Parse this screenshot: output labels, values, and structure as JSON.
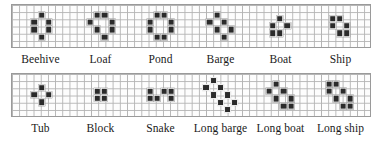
{
  "figure": {
    "grid": {
      "cell_px": 7.2,
      "line_color": "#b3b3b3",
      "border_color": "#9a9a9a",
      "cell_color": "#2b2b2b",
      "background": "#fdfdfd"
    },
    "rows": [
      {
        "row_index": 0,
        "patterns": [
          {
            "name": "Beehive",
            "width": 3,
            "height": 4,
            "cells": [
              [
                0,
                1
              ],
              [
                1,
                0
              ],
              [
                1,
                2
              ],
              [
                2,
                0
              ],
              [
                2,
                2
              ],
              [
                3,
                1
              ]
            ]
          },
          {
            "name": "Loaf",
            "width": 4,
            "height": 4,
            "cells": [
              [
                0,
                1
              ],
              [
                0,
                2
              ],
              [
                1,
                0
              ],
              [
                1,
                3
              ],
              [
                2,
                1
              ],
              [
                2,
                3
              ],
              [
                3,
                2
              ]
            ]
          },
          {
            "name": "Pond",
            "width": 4,
            "height": 4,
            "cells": [
              [
                0,
                1
              ],
              [
                0,
                2
              ],
              [
                1,
                0
              ],
              [
                1,
                3
              ],
              [
                2,
                0
              ],
              [
                2,
                3
              ],
              [
                3,
                1
              ],
              [
                3,
                2
              ]
            ]
          },
          {
            "name": "Barge",
            "width": 4,
            "height": 4,
            "cells": [
              [
                0,
                1
              ],
              [
                1,
                0
              ],
              [
                1,
                2
              ],
              [
                2,
                1
              ],
              [
                2,
                3
              ],
              [
                3,
                2
              ]
            ]
          },
          {
            "name": "Boat",
            "width": 3,
            "height": 3,
            "cells": [
              [
                0,
                1
              ],
              [
                1,
                0
              ],
              [
                1,
                2
              ],
              [
                2,
                0
              ],
              [
                2,
                1
              ]
            ]
          },
          {
            "name": "Ship",
            "width": 3,
            "height": 3,
            "cells": [
              [
                0,
                0
              ],
              [
                0,
                1
              ],
              [
                1,
                0
              ],
              [
                1,
                2
              ],
              [
                2,
                1
              ],
              [
                2,
                2
              ]
            ]
          }
        ]
      },
      {
        "row_index": 1,
        "patterns": [
          {
            "name": "Tub",
            "width": 3,
            "height": 3,
            "cells": [
              [
                0,
                1
              ],
              [
                1,
                0
              ],
              [
                1,
                2
              ],
              [
                2,
                1
              ]
            ]
          },
          {
            "name": "Block",
            "width": 2,
            "height": 2,
            "cells": [
              [
                0,
                0
              ],
              [
                0,
                1
              ],
              [
                1,
                0
              ],
              [
                1,
                1
              ]
            ]
          },
          {
            "name": "Snake",
            "width": 4,
            "height": 2,
            "cells": [
              [
                0,
                0
              ],
              [
                0,
                2
              ],
              [
                0,
                3
              ],
              [
                1,
                0
              ],
              [
                1,
                1
              ],
              [
                1,
                3
              ]
            ]
          },
          {
            "name": "Long barge",
            "width": 5,
            "height": 5,
            "cells": [
              [
                0,
                1
              ],
              [
                1,
                0
              ],
              [
                1,
                2
              ],
              [
                2,
                1
              ],
              [
                2,
                3
              ],
              [
                3,
                2
              ],
              [
                3,
                4
              ],
              [
                4,
                3
              ]
            ]
          },
          {
            "name": "Long boat",
            "width": 4,
            "height": 4,
            "cells": [
              [
                0,
                1
              ],
              [
                1,
                0
              ],
              [
                1,
                2
              ],
              [
                2,
                1
              ],
              [
                2,
                3
              ],
              [
                3,
                2
              ],
              [
                3,
                3
              ]
            ]
          },
          {
            "name": "Long ship",
            "width": 4,
            "height": 4,
            "cells": [
              [
                0,
                0
              ],
              [
                0,
                1
              ],
              [
                1,
                0
              ],
              [
                1,
                2
              ],
              [
                2,
                1
              ],
              [
                2,
                3
              ],
              [
                3,
                2
              ],
              [
                3,
                3
              ]
            ]
          }
        ]
      }
    ]
  },
  "chart_data": {
    "type": "table",
    "categories": [
      "Beehive",
      "Loaf",
      "Pond",
      "Barge",
      "Boat",
      "Ship",
      "Tub",
      "Block",
      "Snake",
      "Long barge",
      "Long boat",
      "Long ship"
    ],
    "values": [
      6,
      7,
      8,
      6,
      5,
      6,
      4,
      4,
      6,
      8,
      7,
      8
    ],
    "xlabel": "Still life",
    "ylabel": "Live cells",
    "grid": true,
    "legend": "none"
  }
}
